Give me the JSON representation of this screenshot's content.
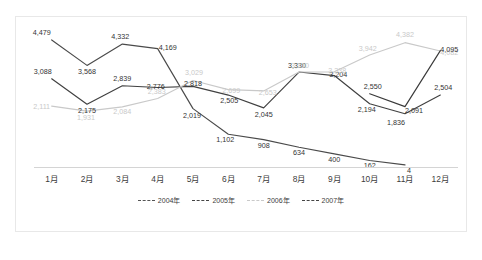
{
  "chart_data": {
    "type": "line",
    "title": "",
    "subtitle": "",
    "xlabel": "",
    "ylabel": "",
    "grid": false,
    "legend_position": "bottom",
    "ylim": [
      0,
      4800
    ],
    "categories": [
      "1月",
      "2月",
      "3月",
      "4月",
      "5月",
      "6月",
      "7月",
      "8月",
      "9月",
      "10月",
      "11月",
      "12月"
    ],
    "series": [
      {
        "name": "2004年",
        "color": "#4a4a4a",
        "style": "dashed",
        "values": [
          4479,
          3568,
          4332,
          4169,
          2019,
          1102,
          908,
          634,
          400,
          162,
          4,
          null
        ],
        "labels": [
          "4,479",
          "3,568",
          "4,332",
          "4,169",
          "2,019",
          "1,102",
          "908",
          "634",
          "400",
          "162",
          "4",
          ""
        ]
      },
      {
        "name": "2005年",
        "color": "#404040",
        "style": "dashed",
        "values": [
          3088,
          2175,
          2839,
          2776,
          2818,
          2505,
          2045,
          3330,
          3204,
          2194,
          1836,
          2504
        ],
        "labels": [
          "3,088",
          "2,175",
          "2,839",
          "2,776",
          "2,818",
          "2,505",
          "2,045",
          "3,330",
          "3,204",
          "2,194",
          "1,836",
          "2,504"
        ]
      },
      {
        "name": "2006年",
        "color": "#c9c9c9",
        "style": "dashed",
        "values": [
          2111,
          1931,
          2084,
          2383,
          3029,
          2699,
          2653,
          3330,
          3338,
          3942,
          4382,
          4082
        ],
        "labels": [
          "2,111",
          "1,931",
          "2,084",
          "2,383",
          "3,029",
          "2,699",
          "2,653",
          "3,330",
          "3,338",
          "3,942",
          "4,382",
          "4,082"
        ]
      },
      {
        "name": "2007年",
        "color": "#3a3a3a",
        "style": "dashed",
        "values": [
          null,
          null,
          null,
          null,
          null,
          null,
          null,
          null,
          null,
          2550,
          2091,
          4095
        ],
        "labels": [
          "",
          "",
          "",
          "",
          "",
          "",
          "",
          "",
          "",
          "2,550",
          "2,091",
          "4,095"
        ]
      }
    ]
  },
  "legend": {
    "items": [
      {
        "label": "2004年",
        "color": "#555555"
      },
      {
        "label": "2005年",
        "color": "#444444"
      },
      {
        "label": "2006年",
        "color": "#c9c9c9"
      },
      {
        "label": "2007年",
        "color": "#444444"
      }
    ]
  },
  "axis": {
    "x_ticks": [
      "1月",
      "2月",
      "3月",
      "4月",
      "5月",
      "6月",
      "7月",
      "8月",
      "9月",
      "10月",
      "11月",
      "12月"
    ]
  }
}
